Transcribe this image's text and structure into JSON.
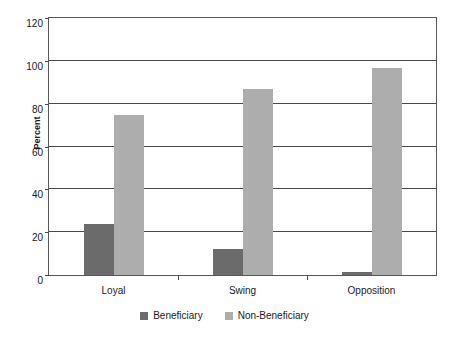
{
  "chart_data": {
    "type": "bar",
    "title": "",
    "subtitle": "",
    "xlabel": "",
    "ylabel": "Percent",
    "categories": [
      "Loyal",
      "Swing",
      "Opposition"
    ],
    "series": [
      {
        "name": "Beneficiary",
        "color": "#6b6b6b",
        "values": [
          24,
          12,
          1.5
        ]
      },
      {
        "name": "Non-Beneficiary",
        "color": "#adadad",
        "values": [
          74.5,
          87,
          96.5
        ]
      }
    ],
    "ylim": [
      0,
      120
    ],
    "yticks": [
      0,
      20,
      40,
      60,
      80,
      100,
      120
    ],
    "ytick_labels": [
      "0",
      "20",
      "40",
      "60",
      "80",
      "100",
      "120"
    ],
    "grid": "horizontal",
    "legend_position": "bottom-center",
    "frame": "box"
  }
}
